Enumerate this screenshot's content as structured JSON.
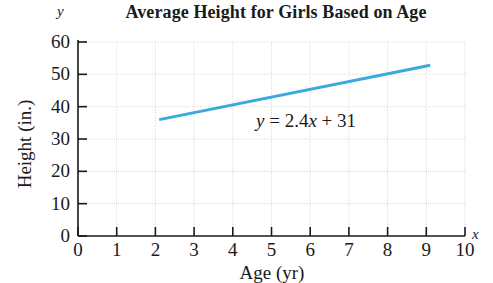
{
  "chart_data": {
    "type": "line",
    "title": "Average Height for Girls Based on Age",
    "xlabel": "Age (yr)",
    "ylabel": "Height (in.)",
    "x_axis_variable": "x",
    "y_axis_variable": "y",
    "xlim": [
      0,
      10
    ],
    "ylim": [
      0,
      60
    ],
    "xticks": [
      "0",
      "1",
      "2",
      "3",
      "4",
      "5",
      "6",
      "7",
      "8",
      "9",
      "10"
    ],
    "yticks": [
      "0",
      "10",
      "20",
      "30",
      "40",
      "50",
      "60"
    ],
    "xtick_values": [
      0,
      1,
      2,
      3,
      4,
      5,
      6,
      7,
      8,
      9,
      10
    ],
    "ytick_values": [
      0,
      10,
      20,
      30,
      40,
      50,
      60
    ],
    "grid": true,
    "legend": "none",
    "annotation": {
      "text": "y = 2.4x + 31",
      "parts": {
        "y": "y",
        "equals": " = ",
        "slope": "2.4",
        "x": "x",
        "plus": " + ",
        "intercept": "31"
      },
      "x": 5.1,
      "y": 37
    },
    "series": [
      {
        "name": "y = 2.4x + 31",
        "color": "#3ba9dd",
        "line_width": 3,
        "x": [
          2.1,
          9.1
        ],
        "values": [
          36.0,
          52.8
        ],
        "equation": "y = 2.4x + 31",
        "slope": 2.4,
        "intercept": 31
      }
    ]
  },
  "colors": {
    "line": "#3ba9dd",
    "axis": "#1a1a1a",
    "grid": "#dcdcdc",
    "text": "#1a1a1a",
    "background": "#ffffff"
  }
}
